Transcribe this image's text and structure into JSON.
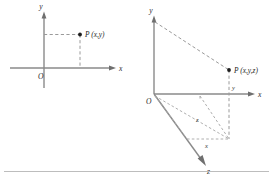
{
  "figure": {
    "background_color": "#ffffff",
    "axis_color": "#8a8a8a",
    "guide_color": "#9a9a9a",
    "label_color": "#2b2b2b",
    "point_color": "#1d1d1d",
    "rule_color": "#bdbdbd",
    "panels": [
      {
        "id": "plane-2d",
        "type": "2d-cartesian",
        "axes": [
          {
            "name": "y-axis",
            "label": "y",
            "orientation": "vertical",
            "arrow": "up"
          },
          {
            "name": "x-axis",
            "label": "x",
            "orientation": "horizontal",
            "arrow": "right"
          }
        ],
        "origin_label": "O",
        "point": {
          "name": "P",
          "label": "P (x,y)",
          "coordinates": [
            "x",
            "y"
          ]
        },
        "guides": [
          {
            "from": "y-axis",
            "to": "P",
            "style": "dashed"
          },
          {
            "from": "x-axis",
            "to": "P",
            "style": "dashed"
          }
        ]
      },
      {
        "id": "space-3d",
        "type": "3d-cartesian",
        "axes": [
          {
            "name": "y-axis",
            "label": "y",
            "orientation": "vertical",
            "arrow": "up"
          },
          {
            "name": "x-axis",
            "label": "x",
            "orientation": "horizontal",
            "arrow": "right"
          },
          {
            "name": "z-axis",
            "label": "z",
            "orientation": "oblique-down-left",
            "arrow": "down-left"
          }
        ],
        "origin_label": "O",
        "point": {
          "name": "P",
          "label": "P (x,y,z)",
          "coordinates": [
            "x",
            "y",
            "z"
          ]
        },
        "segment_labels": [
          {
            "name": "y-segment",
            "label": "y"
          },
          {
            "name": "z-segment",
            "label": "z"
          },
          {
            "name": "x-segment",
            "label": "x"
          }
        ],
        "guides": [
          {
            "from": "y-axis-top",
            "to": "P",
            "style": "dashed"
          },
          {
            "from": "P",
            "to": "foot",
            "style": "dashed"
          },
          {
            "from": "origin",
            "to": "foot",
            "style": "dashed"
          },
          {
            "from": "origin",
            "to": "z-foot",
            "style": "dashed"
          },
          {
            "from": "z-foot",
            "to": "foot",
            "style": "dashed"
          },
          {
            "from": "x-foot",
            "to": "foot",
            "style": "dashed"
          }
        ]
      }
    ]
  }
}
